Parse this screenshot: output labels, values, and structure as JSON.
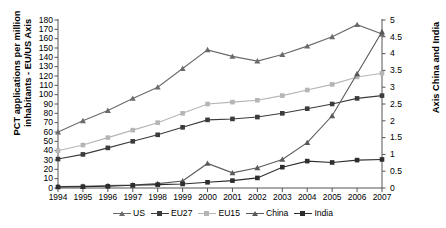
{
  "chart_data": {
    "type": "line",
    "title": "",
    "xlabel": "",
    "ylabel": "PCT applications per million inhabitants - EU/US Axis",
    "ylabel_right": "Axis China and India",
    "categories": [
      1994,
      1995,
      1996,
      1997,
      1998,
      1999,
      2000,
      2001,
      2002,
      2003,
      2004,
      2005,
      2006,
      2007
    ],
    "ylim": [
      0,
      180
    ],
    "ylim_right": [
      0,
      5
    ],
    "yticks": [
      0,
      10,
      20,
      30,
      40,
      50,
      60,
      70,
      80,
      90,
      100,
      110,
      120,
      130,
      140,
      150,
      160,
      170,
      180
    ],
    "yticks_right": [
      0,
      0.5,
      1,
      1.5,
      2,
      2.5,
      3,
      3.5,
      4,
      4.5,
      5
    ],
    "xticks": [
      "1994",
      "1995",
      "1996",
      "1997",
      "1998",
      "1999",
      "2000",
      "2001",
      "2002",
      "2003",
      "2004",
      "2005",
      "2006",
      "2007"
    ],
    "grid": false,
    "legend_position": "bottom",
    "series": [
      {
        "name": "US",
        "axis": "left",
        "marker": "triangle",
        "color": "#6b6b6b",
        "values": [
          60,
          72,
          83,
          96,
          108,
          128,
          148,
          141,
          136,
          143,
          152,
          162,
          175,
          165
        ]
      },
      {
        "name": "EU27",
        "axis": "left",
        "marker": "square",
        "color": "#3b3b3b",
        "values": [
          31,
          36,
          43,
          50,
          57,
          65,
          73,
          74,
          76,
          80,
          85,
          90,
          96,
          99
        ]
      },
      {
        "name": "EU15",
        "axis": "left",
        "marker": "square",
        "color": "#b5b5b5",
        "values": [
          40,
          46,
          54,
          62,
          70,
          80,
          90,
          92,
          94,
          99,
          105,
          111,
          119,
          123
        ]
      },
      {
        "name": "China",
        "axis": "right",
        "marker": "triangle",
        "color": "#5a5a5a",
        "values": [
          0.04,
          0.05,
          0.07,
          0.09,
          0.13,
          0.21,
          0.73,
          0.45,
          0.6,
          0.85,
          1.35,
          2.15,
          3.4,
          4.65
        ]
      },
      {
        "name": "India",
        "axis": "right",
        "marker": "square",
        "color": "#2d2d2d",
        "values": [
          0.03,
          0.04,
          0.05,
          0.08,
          0.1,
          0.12,
          0.17,
          0.22,
          0.3,
          0.62,
          0.8,
          0.76,
          0.83,
          0.85
        ]
      }
    ]
  },
  "legend": {
    "items": [
      {
        "label": "US",
        "marker": "triangle",
        "color": "#6b6b6b"
      },
      {
        "label": "EU27",
        "marker": "square",
        "color": "#3b3b3b"
      },
      {
        "label": "EU15",
        "marker": "square",
        "color": "#b5b5b5"
      },
      {
        "label": "China",
        "marker": "triangle",
        "color": "#5a5a5a"
      },
      {
        "label": "India",
        "marker": "square",
        "color": "#2d2d2d"
      }
    ]
  },
  "axes": {
    "left_title": "PCT applications per million inhabitants - EU/US Axis",
    "right_title": "Axis China and India"
  }
}
